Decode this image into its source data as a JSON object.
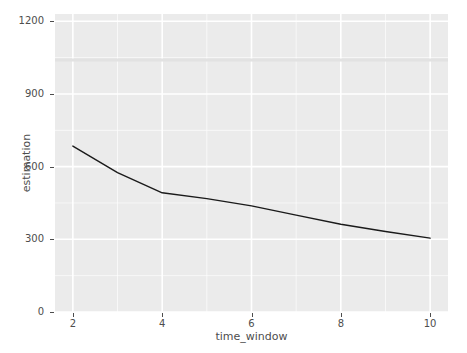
{
  "chart_data": {
    "type": "line",
    "title": "",
    "xlabel": "time_window",
    "ylabel": "estimation",
    "xlim": [
      1.6,
      10.4
    ],
    "ylim": [
      0,
      1230
    ],
    "xticks": [
      2,
      4,
      6,
      8,
      10
    ],
    "xtick_labels": [
      "2",
      "4",
      "6",
      "8",
      "10"
    ],
    "yticks": [
      0,
      300,
      600,
      900,
      1200
    ],
    "ytick_labels": [
      "0",
      "300",
      "600",
      "900",
      "1200"
    ],
    "grid": true,
    "grid_color": "#ffffff",
    "panel_background": "#ebebeb",
    "legend": "none",
    "series": [
      {
        "name": "estimation",
        "color": "#1a1a1a",
        "line_width": 1.4,
        "x": [
          2,
          3,
          4,
          5,
          6,
          7,
          8,
          9,
          10
        ],
        "values": [
          685,
          575,
          492,
          468,
          438,
          400,
          362,
          332,
          305
        ]
      }
    ],
    "reference_band": {
      "description": "faint horizontal band",
      "y": 1040,
      "color": "#e2e2e2"
    }
  },
  "axes": {
    "y_title": "estimation",
    "x_title": "time_window"
  }
}
